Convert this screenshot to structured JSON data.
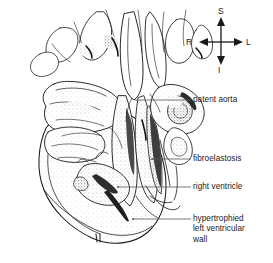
{
  "figure": {
    "kind": "anatomical-line-drawing",
    "background_color": "#ffffff",
    "ink_color": "#1a1a1a"
  },
  "orientation_compass": {
    "name": "anatomical-orientation-indicator",
    "superior": "S",
    "inferior": "I",
    "right": "R",
    "left": "L"
  },
  "labels": [
    {
      "id": "patent-aorta",
      "text": "patent aorta"
    },
    {
      "id": "fibroelastosis",
      "text": "fibroelastosis"
    },
    {
      "id": "right-ventricle",
      "text": "right ventricle"
    },
    {
      "id": "hypertrophied-left-ventricular-wall",
      "line1": "hypertrophied",
      "line2": "left ventricular",
      "line3": "wall"
    }
  ]
}
